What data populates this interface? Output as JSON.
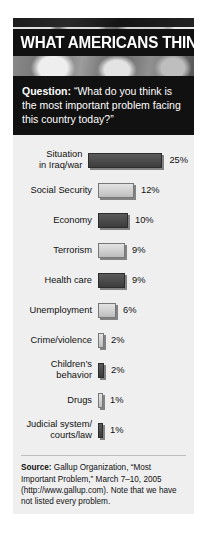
{
  "panel": {
    "title": "WHAT AMERICANS THINK",
    "header_image": "american-flag-photo"
  },
  "question": {
    "label": "Question:",
    "text": "“What do you think is the most important problem facing this country today?”"
  },
  "source": {
    "label": "Source:",
    "text": "Gallup Organization, “Most Important Problem,” March 7–10, 2005 (http://www.gallup.com). Note that we have not listed every problem."
  },
  "chart_data": {
    "type": "bar",
    "title": "WHAT AMERICANS THINK",
    "orientation": "horizontal",
    "xlabel": "",
    "ylabel": "",
    "xlim": [
      0,
      25
    ],
    "grid": false,
    "legend": "none",
    "value_suffix": "%",
    "categories": [
      "Situation in Iraq/war",
      "Social Security",
      "Economy",
      "Terrorism",
      "Health care",
      "Unemployment",
      "Crime/violence",
      "Children’s behavior",
      "Drugs",
      "Judicial system/ courts/law"
    ],
    "values": [
      25,
      12,
      10,
      9,
      9,
      6,
      2,
      2,
      1,
      1
    ],
    "value_labels": [
      "25%",
      "12%",
      "10%",
      "9%",
      "9%",
      "6%",
      "2%",
      "2%",
      "1%",
      "1%"
    ],
    "bar_styles": [
      "dark",
      "light",
      "dark",
      "light",
      "dark",
      "light",
      "light",
      "dark",
      "light",
      "dark"
    ],
    "rows": [
      {
        "label_line1": "Situation",
        "label_line2": "in Iraq/war",
        "value": 25,
        "value_label": "25%",
        "style": "dark"
      },
      {
        "label_line1": "Social Security",
        "label_line2": "",
        "value": 12,
        "value_label": "12%",
        "style": "light"
      },
      {
        "label_line1": "Economy",
        "label_line2": "",
        "value": 10,
        "value_label": "10%",
        "style": "dark"
      },
      {
        "label_line1": "Terrorism",
        "label_line2": "",
        "value": 9,
        "value_label": "9%",
        "style": "light"
      },
      {
        "label_line1": "Health care",
        "label_line2": "",
        "value": 9,
        "value_label": "9%",
        "style": "dark"
      },
      {
        "label_line1": "Unemployment",
        "label_line2": "",
        "value": 6,
        "value_label": "6%",
        "style": "light"
      },
      {
        "label_line1": "Crime/violence",
        "label_line2": "",
        "value": 2,
        "value_label": "2%",
        "style": "light"
      },
      {
        "label_line1": "Children’s",
        "label_line2": "behavior",
        "value": 2,
        "value_label": "2%",
        "style": "dark"
      },
      {
        "label_line1": "Drugs",
        "label_line2": "",
        "value": 1,
        "value_label": "1%",
        "style": "light"
      },
      {
        "label_line1": "Judicial system/",
        "label_line2": "courts/law",
        "value": 1,
        "value_label": "1%",
        "style": "dark"
      }
    ]
  },
  "colors": {
    "panel_bg": "#efefef",
    "header_band": "#111111",
    "title_text": "#ffffff",
    "bar_light": "#cfcfcf",
    "bar_dark": "#4a4a4a",
    "text": "#111111"
  }
}
